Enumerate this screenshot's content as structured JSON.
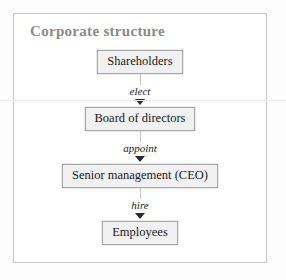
{
  "figure": {
    "title": "Corporate structure",
    "title_color": "#8a8a8a",
    "frame_border_color": "#c9c9c9",
    "node_fill_color": "#f1f1f1",
    "node_border_color": "#a8a8a8",
    "connector_color": "#c4c4c4",
    "arrow_color": "#2b2b2b"
  },
  "chart_data": {
    "type": "diagram",
    "title": "Corporate structure",
    "nodes": [
      {
        "id": "shareholders",
        "label": "Shareholders",
        "level": 0
      },
      {
        "id": "board",
        "label": "Board of directors",
        "level": 1
      },
      {
        "id": "senior",
        "label": "Senior management (CEO)",
        "level": 2
      },
      {
        "id": "employees",
        "label": "Employees",
        "level": 3
      }
    ],
    "edges": [
      {
        "from": "shareholders",
        "to": "board",
        "label": "elect"
      },
      {
        "from": "board",
        "to": "senior",
        "label": "appoint"
      },
      {
        "from": "senior",
        "to": "employees",
        "label": "hire"
      }
    ],
    "orientation": "top-down"
  },
  "nodes": {
    "shareholders": "Shareholders",
    "board": "Board of directors",
    "senior": "Senior management (CEO)",
    "employees": "Employees"
  },
  "edges": {
    "elect": "elect",
    "appoint": "appoint",
    "hire": "hire"
  }
}
